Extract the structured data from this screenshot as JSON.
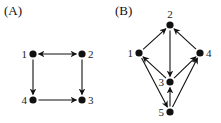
{
  "panels": [
    {
      "label": "(A)",
      "nodes": [
        {
          "id": "1",
          "label": "1",
          "x": 33,
          "y": 54,
          "label_pos": "left"
        },
        {
          "id": "2",
          "label": "2",
          "x": 82,
          "y": 54,
          "label_pos": "right"
        },
        {
          "id": "3",
          "label": "3",
          "x": 82,
          "y": 100,
          "label_pos": "right"
        },
        {
          "id": "4",
          "label": "4",
          "x": 33,
          "y": 100,
          "label_pos": "left"
        }
      ],
      "edges": [
        {
          "from": "1",
          "to": "2",
          "bidirectional": true
        },
        {
          "from": "1",
          "to": "4",
          "bidirectional": false
        },
        {
          "from": "2",
          "to": "3",
          "bidirectional": false
        },
        {
          "from": "4",
          "to": "3",
          "bidirectional": false
        }
      ]
    },
    {
      "label": "(B)",
      "nodes": [
        {
          "id": "1",
          "label": "1",
          "x": 139,
          "y": 53,
          "label_pos": "left"
        },
        {
          "id": "2",
          "label": "2",
          "x": 170,
          "y": 25,
          "label_pos": "top"
        },
        {
          "id": "3",
          "label": "3",
          "x": 170,
          "y": 82,
          "label_pos": "left"
        },
        {
          "id": "4",
          "label": "4",
          "x": 200,
          "y": 53,
          "label_pos": "right"
        },
        {
          "id": "5",
          "label": "5",
          "x": 170,
          "y": 112,
          "label_pos": "left"
        }
      ],
      "edges": [
        {
          "from": "1",
          "to": "2",
          "bidirectional": false
        },
        {
          "from": "4",
          "to": "2",
          "bidirectional": false
        },
        {
          "from": "2",
          "to": "3",
          "bidirectional": false
        },
        {
          "from": "3",
          "to": "1",
          "bidirectional": false
        },
        {
          "from": "3",
          "to": "4",
          "bidirectional": false
        },
        {
          "from": "1",
          "to": "5",
          "bidirectional": false
        },
        {
          "from": "5",
          "to": "3",
          "bidirectional": false
        },
        {
          "from": "5",
          "to": "4",
          "bidirectional": false
        }
      ]
    }
  ],
  "colors": {
    "node": "#111111",
    "edge": "#111111",
    "background": "#ffffff"
  }
}
